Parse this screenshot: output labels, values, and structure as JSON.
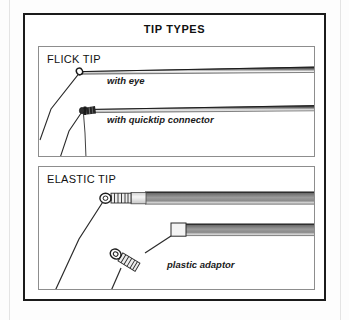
{
  "figure": {
    "title": "TIP TYPES",
    "type": "technical-line-illustration",
    "background_color": "#ffffff",
    "line_color": "#1b1b1b",
    "rod_grey": "#8f8f8f",
    "panel_border_color": "#8d8d8d",
    "frame_color": "#1b1b1b"
  },
  "panels": [
    {
      "id": "flick-tip",
      "label": "FLICK TIP",
      "callouts": [
        {
          "id": "with-eye",
          "text": "with eye"
        },
        {
          "id": "with-quicktip-connector",
          "text": "with quicktip connector"
        }
      ],
      "parts": [
        {
          "name": "thin tapered rod with eye ring",
          "count": 1
        },
        {
          "name": "thin tapered rod with quicktip connector",
          "count": 1
        },
        {
          "name": "elastic line",
          "count": 2
        }
      ]
    },
    {
      "id": "elastic-tip",
      "label": "ELASTIC TIP",
      "callouts": [
        {
          "id": "plastic-adaptor",
          "text": "plastic adaptor"
        }
      ],
      "parts": [
        {
          "name": "thick grey rod with ribbed connector",
          "count": 1
        },
        {
          "name": "thick grey rod with plastic adaptor block",
          "count": 1
        },
        {
          "name": "elastic line",
          "count": 2
        },
        {
          "name": "ribbed connector",
          "count": 2
        }
      ]
    }
  ]
}
